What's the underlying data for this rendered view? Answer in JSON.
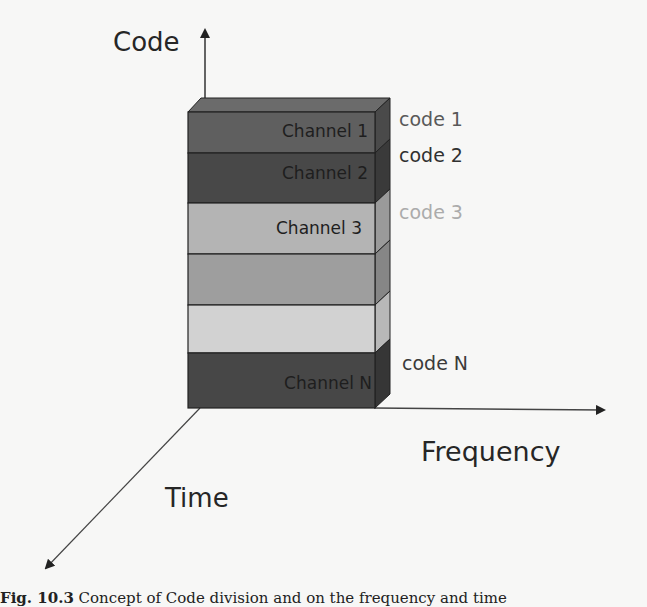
{
  "diagram": {
    "axes": {
      "code": "Code",
      "frequency": "Frequency",
      "time": "Time"
    },
    "bands": [
      {
        "label": "Channel 1",
        "color": "#5f5f5f",
        "side": "#4a4a4a",
        "top": "#6b6b6b"
      },
      {
        "label": "Channel 2",
        "color": "#484848",
        "side": "#3a3a3a"
      },
      {
        "label": "Channel 3",
        "color": "#b4b4b4",
        "side": "#9a9a9a"
      },
      {
        "label": "",
        "color": "#9e9e9e",
        "side": "#868686"
      },
      {
        "label": "",
        "color": "#d2d2d2",
        "side": "#b8b8b8"
      },
      {
        "label": "Channel N",
        "color": "#474747",
        "side": "#363636"
      }
    ],
    "codes": [
      {
        "label": "code 1",
        "color": "#595959"
      },
      {
        "label": "code 2",
        "color": "#303030"
      },
      {
        "label": "code 3",
        "color": "#ababab"
      },
      {
        "label": "code N",
        "color": "#3a3a3a"
      }
    ]
  },
  "caption": {
    "prefix": "Fig. 10.3",
    "text": "Concept of Code division and on the frequency and time"
  }
}
